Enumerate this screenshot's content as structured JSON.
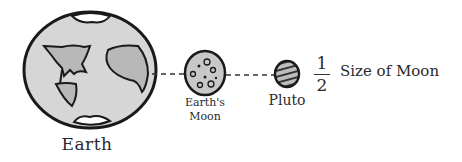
{
  "diagram": {
    "bodies": [
      {
        "id": "earth",
        "label": "Earth"
      },
      {
        "id": "moon",
        "label_line1": "Earth's",
        "label_line2": "Moon"
      },
      {
        "id": "pluto",
        "label": "Pluto"
      }
    ],
    "comparison": {
      "numerator": "1",
      "denominator": "2",
      "text": "Size of Moon"
    },
    "colors": {
      "outline": "#1a1a1a",
      "earth_ocean": "#d6d6d6",
      "earth_land": "#b8b8b8",
      "ice_cap": "#ffffff",
      "moon_fill": "#c8c8c8",
      "pluto_fill": "#bdbdbd"
    }
  }
}
